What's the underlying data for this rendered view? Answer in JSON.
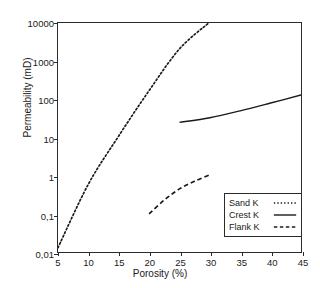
{
  "chart_data": {
    "type": "line",
    "title": "",
    "xlabel": "Porosity (%)",
    "ylabel": "Permeability (mD)",
    "xscale": "linear",
    "yscale": "log",
    "xlim": [
      5,
      45
    ],
    "ylim": [
      0.01,
      10000
    ],
    "grid": false,
    "legend_position": "lower right (inside axes)",
    "xticks": [
      "5",
      "10",
      "15",
      "20",
      "25",
      "30",
      "35",
      "40",
      "45"
    ],
    "xtick_values": [
      5,
      10,
      15,
      20,
      25,
      30,
      35,
      40,
      45
    ],
    "yticks": [
      "0,01",
      "0,1",
      "1",
      "10",
      "100",
      "1000",
      "10000"
    ],
    "ytick_values": [
      0.01,
      0.1,
      1,
      10,
      100,
      1000,
      10000
    ],
    "decimal_separator": "comma",
    "series": [
      {
        "name": "Sand K",
        "style": "dotted",
        "color": "#1a1a1a",
        "x": [
          5,
          10,
          15,
          20,
          25,
          29.8
        ],
        "values": [
          0.013,
          0.6,
          11,
          170,
          2100,
          10000
        ]
      },
      {
        "name": "Crest K",
        "style": "solid",
        "color": "#1a1a1a",
        "x": [
          25,
          30,
          35,
          40,
          45
        ],
        "values": [
          25,
          33,
          50,
          80,
          130
        ]
      },
      {
        "name": "Flank K",
        "style": "dashed",
        "color": "#1a1a1a",
        "x": [
          20,
          22.5,
          25,
          27.5,
          30
        ],
        "values": [
          0.1,
          0.23,
          0.45,
          0.72,
          1.05
        ]
      }
    ]
  },
  "legend": {
    "items": [
      {
        "label": "Sand K",
        "style": "dotted"
      },
      {
        "label": "Crest K",
        "style": "solid"
      },
      {
        "label": "Flank K",
        "style": "dashed"
      }
    ]
  },
  "colors": {
    "axis": "#2b2b2b",
    "text": "#1a1a1a",
    "background": "#ffffff",
    "series": "#1a1a1a"
  }
}
